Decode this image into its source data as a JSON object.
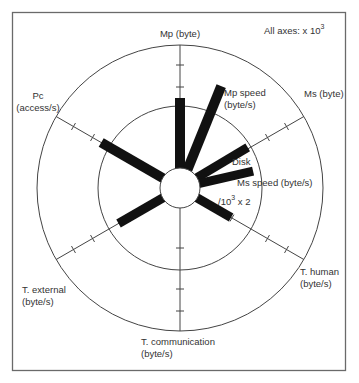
{
  "diagram": {
    "scale_note": "All axes:  x 10",
    "scale_exponent": "3",
    "center": [
      180,
      188
    ],
    "hub_radius": 20,
    "inner_ring_radius": 82,
    "outer_ring_radius": 143,
    "tick_radii": [
      60,
      101,
      123
    ],
    "axes": [
      {
        "id": "mp",
        "angle": 90,
        "label_lines": [
          "Mp (byte)"
        ],
        "label_x": 180,
        "label_y": 37,
        "anchor": "middle"
      },
      {
        "id": "ms",
        "angle": 30,
        "label_lines": [
          "Ms (byte)"
        ],
        "label_x": 304,
        "label_y": 97,
        "anchor": "start"
      },
      {
        "id": "t-human",
        "angle": -30,
        "label_lines": [
          "T. human",
          "(byte/s)"
        ],
        "label_x": 300,
        "label_y": 275,
        "anchor": "start"
      },
      {
        "id": "t-communication",
        "angle": -90,
        "label_lines": [
          "T. communication",
          "(byte/s)"
        ],
        "label_x": 141,
        "label_y": 345,
        "anchor": "start"
      },
      {
        "id": "t-external",
        "angle": -150,
        "label_lines": [
          "T. external",
          "(byte/s)"
        ],
        "label_x": 22,
        "label_y": 293,
        "anchor": "start"
      },
      {
        "id": "pc",
        "angle": 150,
        "label_lines": [
          "Pc",
          "(access/s)"
        ],
        "label_x": 38,
        "label_y": 99,
        "anchor": "middle"
      }
    ],
    "bars": [
      {
        "id": "mp",
        "angle": 90,
        "length": 70,
        "width": 10
      },
      {
        "id": "mp-speed",
        "angle": 68,
        "length": 90,
        "width": 10,
        "label_lines": [
          "Mp speed",
          "(byte/s)"
        ],
        "label_x": 224,
        "label_y": 96
      },
      {
        "id": "pc",
        "angle": 150,
        "length": 71,
        "width": 10
      },
      {
        "id": "disk",
        "angle": 31,
        "length": 59,
        "width": 9,
        "label_lines": [
          "Disk"
        ],
        "label_x": 232,
        "label_y": 165
      },
      {
        "id": "ms-speed",
        "angle": 13,
        "length": 55,
        "width": 9,
        "label_lines": [
          "Ms speed (byte/s)"
        ],
        "label_x": 237,
        "label_y": 186
      },
      {
        "id": "t-human",
        "angle": -30,
        "length": 39,
        "width": 9,
        "label_lines": [
          "/10",
          "3",
          " x 2"
        ],
        "label_x": 218,
        "label_y": 205
      },
      {
        "id": "t-external",
        "angle": -150,
        "length": 51,
        "width": 9
      }
    ]
  }
}
